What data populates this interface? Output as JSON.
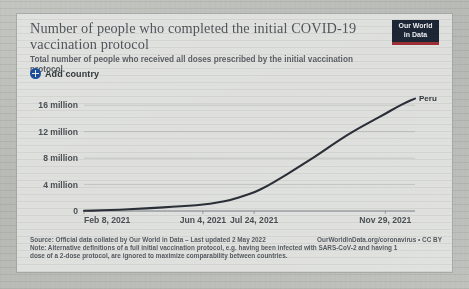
{
  "card": {
    "title": "Number of people who completed the initial COVID-19 vaccination protocol",
    "subtitle": "Total number of people who received all doses prescribed by the initial vaccination protocol.",
    "logo_line1": "Our World",
    "logo_line2": "in Data",
    "add_country_label": "Add country"
  },
  "controls": {
    "add_icon": "circle-plus-icon"
  },
  "footer": {
    "source": "Source: Official data collated by Our World in Data – Last updated 2 May 2022",
    "credit": "OurWorldInData.org/coronavirus • CC BY",
    "note_line1": "Note: Alternative definitions of a full initial vaccination protocol, e.g. having been infected with SARS-CoV-2 and having 1",
    "note_line2": "dose of a 2-dose protocol, are ignored to maximize comparability between countries."
  },
  "colors": {
    "line": "#2b3038",
    "accent_blue": "#1d4f9c",
    "logo_bg": "#1d2635",
    "logo_rule": "#9c2f35",
    "grid": "#b6b9b6",
    "text": "#4b5055"
  },
  "chart_data": {
    "type": "line",
    "title": "Number of people who completed the initial COVID-19 vaccination protocol",
    "subtitle": "Total number of people who received all doses prescribed by the initial vaccination protocol.",
    "xlabel": "",
    "ylabel": "",
    "grid": true,
    "legend_position": "end-of-line",
    "ylim": [
      0,
      18000000
    ],
    "yticks": [
      0,
      4000000,
      8000000,
      12000000,
      16000000
    ],
    "ytick_labels": [
      "0",
      "4 million",
      "8 million",
      "12 million",
      "16 million"
    ],
    "xlim": [
      "2021-02-08",
      "2021-12-28"
    ],
    "xticks": [
      "2021-02-08",
      "2021-06-04",
      "2021-07-24",
      "2021-11-29"
    ],
    "xtick_labels": [
      "Feb 8, 2021",
      "Jun 4, 2021",
      "Jul 24, 2021",
      "Nov 29, 2021"
    ],
    "series": [
      {
        "name": "Peru",
        "color": "#2b3038",
        "end_label": "Peru",
        "x": [
          "2021-02-08",
          "2021-02-25",
          "2021-03-15",
          "2021-04-01",
          "2021-04-18",
          "2021-05-05",
          "2021-05-22",
          "2021-06-04",
          "2021-06-18",
          "2021-07-02",
          "2021-07-16",
          "2021-07-24",
          "2021-08-05",
          "2021-08-18",
          "2021-09-01",
          "2021-09-14",
          "2021-09-28",
          "2021-10-10",
          "2021-10-22",
          "2021-11-04",
          "2021-11-16",
          "2021-11-29",
          "2021-12-10",
          "2021-12-20",
          "2021-12-28"
        ],
        "y": [
          30000,
          90000,
          200000,
          330000,
          470000,
          620000,
          800000,
          950000,
          1250000,
          1700000,
          2400000,
          2800000,
          3700000,
          4900000,
          6200000,
          7500000,
          8900000,
          10200000,
          11400000,
          12600000,
          13600000,
          14700000,
          15700000,
          16500000,
          17000000
        ]
      }
    ]
  }
}
